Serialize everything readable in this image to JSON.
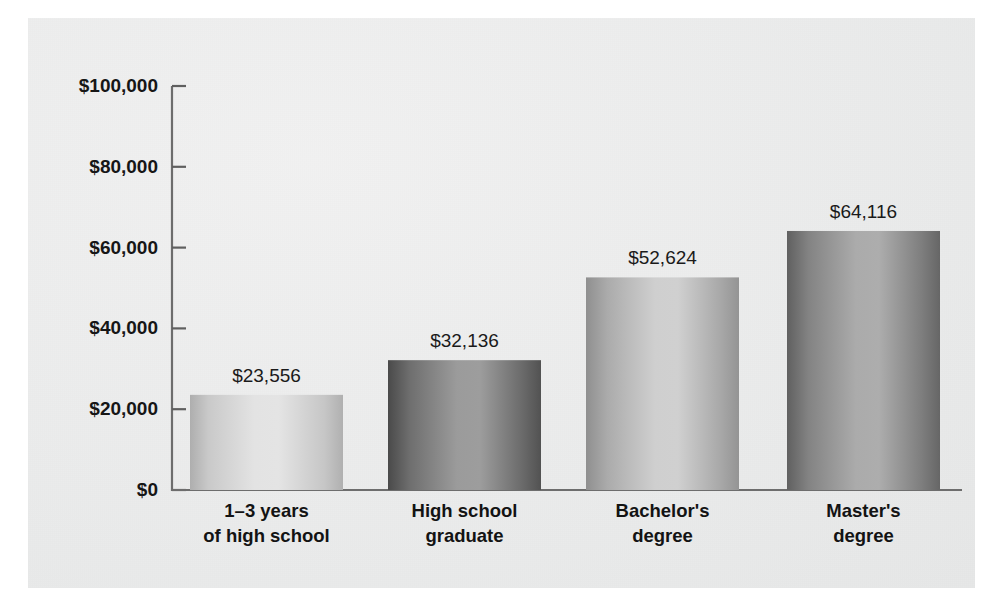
{
  "chart_data": {
    "type": "bar",
    "title": "",
    "subtitle": "",
    "xlabel": "",
    "ylabel": "",
    "categories": [
      "1–3 years\nof high school",
      "High school\ngraduate",
      "Bachelor's\ndegree",
      "Master's\ndegree"
    ],
    "category_lines": [
      [
        "1–3 years",
        "of high school"
      ],
      [
        "High school",
        "graduate"
      ],
      [
        "Bachelor's",
        "degree"
      ],
      [
        "Master's",
        "degree"
      ]
    ],
    "values": [
      23556,
      32136,
      52624,
      64116
    ],
    "value_labels": [
      "$23,556",
      "$32,136",
      "$52,624",
      "$64,116"
    ],
    "ylim": [
      0,
      100000
    ],
    "ytick_values": [
      0,
      20000,
      40000,
      60000,
      80000,
      100000
    ],
    "ytick_labels": [
      "$0",
      "$20,000",
      "$40,000",
      "$60,000",
      "$80,000",
      "$100,000"
    ],
    "grid": false,
    "legend": null,
    "bar_shading": [
      {
        "edge": "#a9a9a9",
        "mid": "#dcdcdc",
        "center": "#e2e2e2"
      },
      {
        "edge": "#4b4b4b",
        "mid": "#8d8d8d",
        "center": "#9a9a9a"
      },
      {
        "edge": "#8d8d8d",
        "mid": "#c4c4c4",
        "center": "#cbcbcb"
      },
      {
        "edge": "#5f5f5f",
        "mid": "#9d9d9d",
        "center": "#a6a6a6"
      }
    ]
  },
  "colors": {
    "panel_background": "#eceded",
    "page_background": "#ffffff",
    "axis": "#6d6d6d",
    "text": "#141414"
  }
}
